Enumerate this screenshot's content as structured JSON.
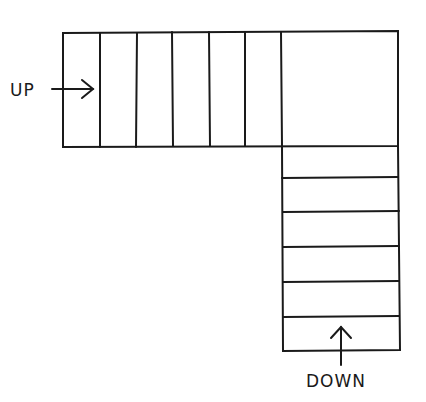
{
  "diagram": {
    "labels": {
      "up": "UP",
      "down": "DOWN"
    },
    "upper_flight_treads": 6,
    "lower_flight_treads": 6,
    "has_landing": true,
    "line_color": "#1a1a1a"
  }
}
